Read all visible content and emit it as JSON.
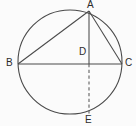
{
  "figure": {
    "name": "circle-with-inscribed-triangle",
    "background_color": "#fbfbfb",
    "stroke_color": "#4a4a4a",
    "label_color": "#2b2b2b"
  },
  "labels": {
    "a": "A",
    "b": "B",
    "c": "C",
    "d": "D",
    "e": "E"
  },
  "label_positions": {
    "a": {
      "x": 87,
      "y": 0
    },
    "b": {
      "x": 6,
      "y": 58
    },
    "c": {
      "x": 125,
      "y": 58
    },
    "d": {
      "x": 79,
      "y": 47
    },
    "e": {
      "x": 85,
      "y": 115
    }
  },
  "geometry": {
    "circle": {
      "cx": 70,
      "cy": 62,
      "r": 52
    },
    "points": {
      "A": {
        "x": 89,
        "y": 11
      },
      "B": {
        "x": 18,
        "y": 64
      },
      "C": {
        "x": 122,
        "y": 64
      },
      "D": {
        "x": 89,
        "y": 64
      },
      "E": {
        "x": 89,
        "y": 113
      }
    },
    "segments": [
      {
        "name": "chord-ba",
        "from": "B",
        "to": "A",
        "style": "solid"
      },
      {
        "name": "chord-ac",
        "from": "A",
        "to": "C",
        "style": "solid"
      },
      {
        "name": "chord-bc",
        "from": "B",
        "to": "C",
        "style": "solid"
      },
      {
        "name": "segment-ad",
        "from": "A",
        "to": "D",
        "style": "solid"
      },
      {
        "name": "segment-de",
        "from": "D",
        "to": "E",
        "style": "dashed"
      }
    ]
  }
}
